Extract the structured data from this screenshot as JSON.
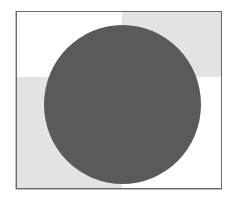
{
  "figure": {
    "colors": {
      "frame_border": "#6a6a6a",
      "light_square": "#ffffff",
      "gray_square": "#e3e3e3",
      "circle_fill": "#5a5a5a"
    },
    "quadrants": [
      {
        "position": "top-left",
        "fill": "light"
      },
      {
        "position": "top-right",
        "fill": "gray"
      },
      {
        "position": "bottom-left",
        "fill": "gray"
      },
      {
        "position": "bottom-right",
        "fill": "light"
      }
    ],
    "shape": {
      "type": "circle",
      "fill": "dark-gray"
    }
  }
}
